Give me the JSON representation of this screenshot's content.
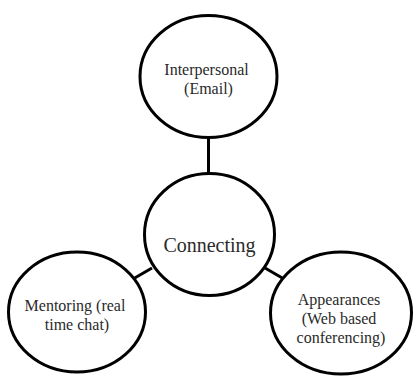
{
  "diagram": {
    "type": "hub-and-spoke",
    "center": {
      "id": "connecting",
      "label_lines": [
        "Connecting"
      ]
    },
    "nodes": [
      {
        "id": "interpersonal",
        "label_lines": [
          "Interpersonal",
          "(Email)"
        ]
      },
      {
        "id": "mentoring",
        "label_lines": [
          "Mentoring (real",
          "time chat)"
        ]
      },
      {
        "id": "appearances",
        "label_lines": [
          "Appearances",
          "(Web based",
          "conferencing)"
        ]
      }
    ],
    "edges": [
      {
        "from": "connecting",
        "to": "interpersonal"
      },
      {
        "from": "connecting",
        "to": "mentoring"
      },
      {
        "from": "connecting",
        "to": "appearances"
      }
    ],
    "colors": {
      "stroke": "#000000",
      "text": "#2a2a2a",
      "background": "#ffffff"
    }
  }
}
